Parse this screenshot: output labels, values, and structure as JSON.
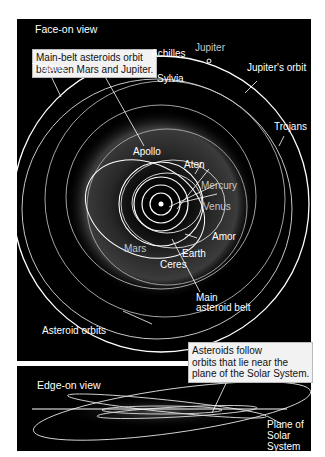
{
  "face_on": {
    "title": "Face-on view",
    "callout": [
      "Main-belt asteroids orbit",
      "between Mars and Jupiter."
    ],
    "labels": {
      "achilles": "Achilles",
      "jupiter": "Jupiter",
      "jupiters_orbit": "Jupiter's orbit",
      "trojans_left": "Trojans",
      "trojans_right": "Trojans",
      "sylvia": "Sylvia",
      "apollo": "Apollo",
      "aten": "Aten",
      "mercury": "Mercury",
      "venus": "Venus",
      "amor": "Amor",
      "mars": "Mars",
      "earth": "Earth",
      "ceres": "Ceres",
      "main_belt_1": "Main",
      "main_belt_2": "asteroid belt",
      "asteroid_orbits": "Asteroid orbits"
    }
  },
  "edge_on": {
    "title": "Edge-on view",
    "callout": [
      "Asteroids follow",
      "orbits that lie near the",
      "plane of the Solar System."
    ],
    "plane_label": [
      "Plane of",
      "Solar",
      "System"
    ]
  },
  "colors": {
    "background": "#000000",
    "orbit": "#ffffff",
    "callout_bg": "#f2f2f2"
  }
}
